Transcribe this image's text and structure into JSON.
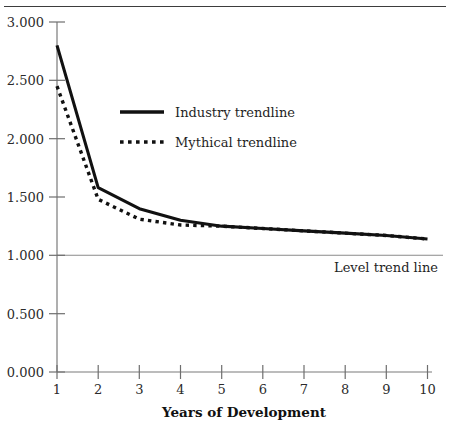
{
  "chart_data": {
    "type": "line",
    "title": "",
    "xlabel": "Years of Development",
    "ylabel": "",
    "xlim": [
      1,
      10
    ],
    "ylim": [
      0.0,
      3.0
    ],
    "grid": false,
    "legend_position": "upper-left-inside",
    "x": [
      1,
      2,
      3,
      4,
      5,
      6,
      7,
      8,
      9,
      10
    ],
    "xtick_labels": [
      "1",
      "2",
      "3",
      "4",
      "5",
      "6",
      "7",
      "8",
      "9",
      "10"
    ],
    "ytick_labels": [
      "0.000",
      "0.500",
      "1.000",
      "1.500",
      "2.000",
      "2.500",
      "3.000"
    ],
    "ytick_values": [
      0.0,
      0.5,
      1.0,
      1.5,
      2.0,
      2.5,
      3.0
    ],
    "series": [
      {
        "name": "Industry trendline",
        "style": "solid",
        "color": "#111111",
        "values": [
          2.8,
          1.58,
          1.4,
          1.3,
          1.25,
          1.23,
          1.21,
          1.19,
          1.17,
          1.14
        ]
      },
      {
        "name": "Mythical trendline",
        "style": "dotted",
        "color": "#111111",
        "values": [
          2.45,
          1.48,
          1.31,
          1.26,
          1.25,
          1.23,
          1.21,
          1.19,
          1.17,
          1.14
        ]
      }
    ],
    "reference_lines": [
      {
        "name": "Level trend line",
        "label": "Level trend line",
        "value": 1.0,
        "orientation": "horizontal",
        "color": "#8a8a8a"
      }
    ],
    "annotations": [
      {
        "text": "Level trend line",
        "x": 7.1,
        "y": 0.88
      }
    ]
  },
  "legend": {
    "items": [
      {
        "label": "Industry trendline",
        "style": "solid"
      },
      {
        "label": "Mythical trendline",
        "style": "dotted"
      }
    ]
  }
}
